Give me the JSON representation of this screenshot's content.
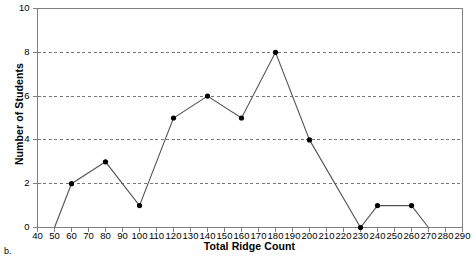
{
  "panel": {
    "letter": "b."
  },
  "chart_data": {
    "type": "line",
    "title": "",
    "xlabel": "Total Ridge Count",
    "ylabel": "Number of Students",
    "xlim": [
      40,
      290
    ],
    "ylim": [
      0,
      10
    ],
    "xticks": [
      40,
      50,
      60,
      70,
      80,
      90,
      100,
      110,
      120,
      130,
      140,
      150,
      160,
      170,
      180,
      190,
      200,
      210,
      220,
      230,
      240,
      250,
      260,
      270,
      280,
      290
    ],
    "yticks": [
      0,
      2,
      4,
      6,
      8,
      10
    ],
    "grid": "horizontal-dashed",
    "legend": "none",
    "x": [
      50,
      60,
      80,
      100,
      120,
      140,
      160,
      180,
      200,
      230,
      240,
      260,
      270
    ],
    "values": [
      0,
      2,
      3,
      1,
      5,
      6,
      5,
      8,
      4,
      0,
      1,
      1,
      0
    ],
    "markers_hidden_at_x": [
      50,
      270
    ],
    "series": [
      {
        "name": "Number of Students",
        "points": [
          {
            "x": 50,
            "y": 0
          },
          {
            "x": 60,
            "y": 2
          },
          {
            "x": 80,
            "y": 3
          },
          {
            "x": 100,
            "y": 1
          },
          {
            "x": 120,
            "y": 5
          },
          {
            "x": 140,
            "y": 6
          },
          {
            "x": 160,
            "y": 5
          },
          {
            "x": 180,
            "y": 8
          },
          {
            "x": 200,
            "y": 4
          },
          {
            "x": 230,
            "y": 0
          },
          {
            "x": 240,
            "y": 1
          },
          {
            "x": 260,
            "y": 1
          },
          {
            "x": 270,
            "y": 0
          }
        ]
      }
    ],
    "colors": {
      "line": "#555555",
      "marker": "#000000",
      "grid": "#777777",
      "axis": "#808080",
      "text": "#000000",
      "background": "#ffffff"
    }
  }
}
